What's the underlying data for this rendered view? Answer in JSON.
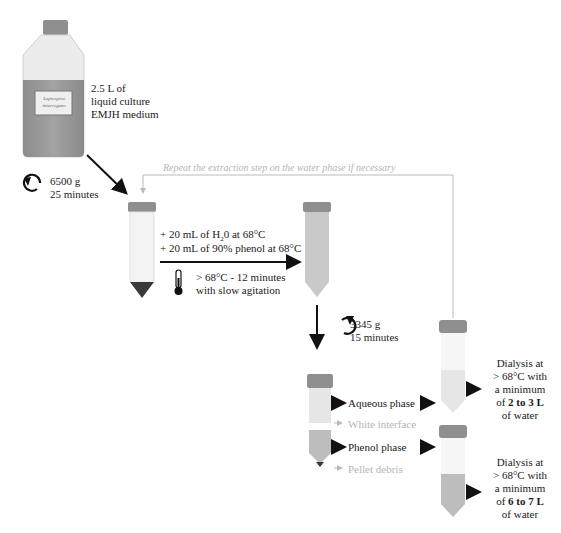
{
  "culture": {
    "bottle_label": "Leptospira interrogans",
    "volume_line1": "2.5 L of",
    "volume_line2": "liquid culture",
    "medium": "EMJH medium"
  },
  "centrifuge1": {
    "speed": "6500 g",
    "time": "25 minutes",
    "icon": "rotate-clockwise-icon"
  },
  "repeat_note": "Repeat the extraction step on the water phase if necessary",
  "extraction": {
    "add_water": "+ 20 mL of H",
    "add_water_sub": "2",
    "add_water_rest": "0 at 68°C",
    "add_phenol": "+ 20 mL of 90% phenol at 68°C",
    "incubation_temp": "> 68°C - 12 minutes",
    "incubation_mode": "with slow agitation",
    "icon": "thermometer-icon"
  },
  "centrifuge2": {
    "speed": "3345 g",
    "time": "15 minutes",
    "icon": "rotate-clockwise-icon"
  },
  "phases": {
    "aqueous": "Aqueous phase",
    "interface": "White interface",
    "phenol": "Phenol phase",
    "pellet": "Pellet debris"
  },
  "dialysis1": {
    "line1": "Dialysis at",
    "line2": "> 68°C with",
    "line3": "a minimum",
    "line4_pre": "of ",
    "line4_bold": "2 to 3 L",
    "line5": "of water"
  },
  "dialysis2": {
    "line1": "Dialysis at",
    "line2": "> 68°C with",
    "line3": "a minimum",
    "line4_pre": "of ",
    "line4_bold": "6 to 7 L",
    "line5": "of water"
  },
  "colors": {
    "cap": "#8a8a8a",
    "bottle_liquid": "#9a9a9a",
    "tube_body": "#f2f2f2",
    "pellet": "#3a3a3a",
    "mix": "#c9c9c9",
    "aqueous": "#e6e6e6",
    "phenol": "#bdbdbd",
    "repeat_line": "#bbbbbb"
  }
}
